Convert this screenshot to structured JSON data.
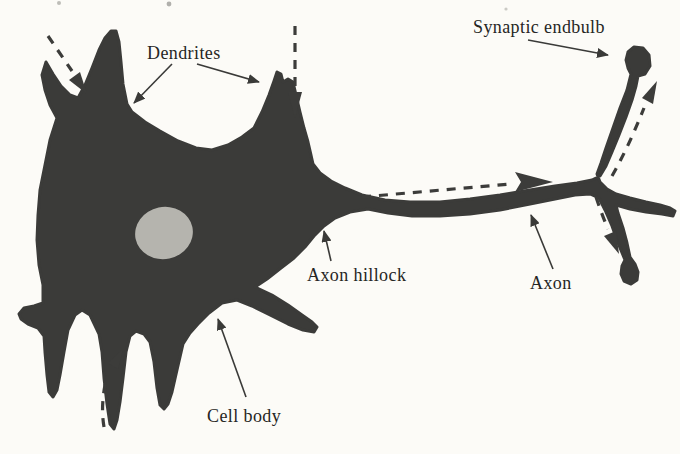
{
  "figure": {
    "type": "labeled-diagram",
    "background_color": "#fcfbf7",
    "ink_color": "#3a3a38",
    "cell_fill_color": "#3b3b39",
    "nucleus_fill_color": "#b5b4ae",
    "label_text_color": "#262624",
    "labels": {
      "dendrites": "Dendrites",
      "synaptic_endbulb": "Synaptic endbulb",
      "axon_hillock": "Axon hillock",
      "axon": "Axon",
      "cell_body": "Cell body"
    }
  }
}
